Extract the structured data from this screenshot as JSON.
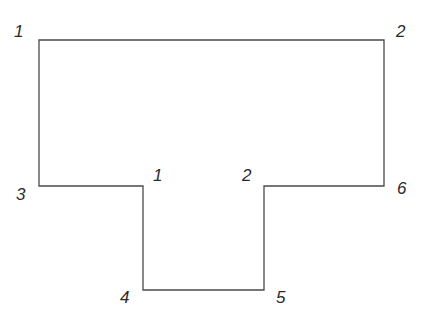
{
  "diagram": {
    "type": "T-shaped polygon outline",
    "stroke_color": "#4a4a4a",
    "text_color": "#2a2a2a",
    "outline_points": [
      [
        39,
        40
      ],
      [
        384,
        40
      ],
      [
        384,
        186
      ],
      [
        264,
        186
      ],
      [
        264,
        290
      ],
      [
        143,
        290
      ],
      [
        143,
        186
      ],
      [
        39,
        186
      ]
    ],
    "labels": [
      {
        "id": "top-left",
        "text": "1",
        "x": 14,
        "y": 37
      },
      {
        "id": "top-right",
        "text": "2",
        "x": 396,
        "y": 37
      },
      {
        "id": "left-bottom",
        "text": "3",
        "x": 16,
        "y": 200
      },
      {
        "id": "inner-left",
        "text": "1",
        "x": 153,
        "y": 181
      },
      {
        "id": "inner-right",
        "text": "2",
        "x": 242,
        "y": 181
      },
      {
        "id": "right-bottom",
        "text": "6",
        "x": 397,
        "y": 194
      },
      {
        "id": "bottom-left",
        "text": "4",
        "x": 120,
        "y": 303
      },
      {
        "id": "bottom-right",
        "text": "5",
        "x": 276,
        "y": 303
      }
    ]
  }
}
